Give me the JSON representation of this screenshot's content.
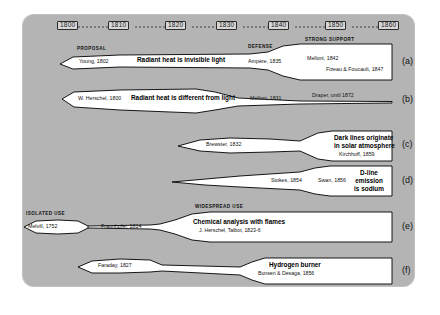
{
  "figure": {
    "type": "timeline-diagram",
    "background_color": "#b4b4b4",
    "band_fill": "#ffffff",
    "band_stroke": "#000000"
  },
  "axis": {
    "name": "decade-axis",
    "ticks": [
      "1800",
      "1810",
      "1820",
      "1830",
      "1840",
      "1850",
      "1860"
    ]
  },
  "rows": [
    {
      "id": "a",
      "label": "(a)",
      "phases": [
        {
          "caption": "PROPOSAL",
          "name": "Young, 1802"
        },
        {
          "caption": "DEFENSE",
          "name": "Ampère, 1835"
        },
        {
          "caption": "STRONG SUPPORT",
          "name": "Melloni, 1842",
          "name2": "Fizeau & Foucault, 1847"
        }
      ],
      "statement": "Radiant heat is invisible light"
    },
    {
      "id": "b",
      "label": "(b)",
      "phases": [
        {
          "name": "W. Herschel, 1800"
        },
        {
          "name": "Melloni, 1831"
        },
        {
          "name": "Draper, until 1872"
        }
      ],
      "statement": "Radiant heat is different from light"
    },
    {
      "id": "c",
      "label": "(c)",
      "phases": [
        {
          "name": "Brewster, 1832"
        },
        {
          "name": "Kirchhoff, 1859"
        }
      ],
      "statement_line1": "Dark lines originate",
      "statement_line2": "in solar atmosphere"
    },
    {
      "id": "d",
      "label": "(d)",
      "phases": [
        {
          "name": "Stokes, 1854"
        },
        {
          "name": "Swan, 1856"
        }
      ],
      "statement_line1": "D-line",
      "statement_line2": "emission",
      "statement_line3": "is sodium"
    },
    {
      "id": "e",
      "label": "(e)",
      "phases": [
        {
          "caption": "ISOLATED USE",
          "name": "Melvill, 1752"
        },
        {
          "name": "Fraunhofer, 1814"
        },
        {
          "caption": "WIDESPREAD USE",
          "name": "J. Herschel, Talbot, 1823-6"
        }
      ],
      "statement": "Chemical analysis  with flames"
    },
    {
      "id": "f",
      "label": "(f)",
      "phases": [
        {
          "name": "Faraday, 1827"
        },
        {
          "name": "Bunsen & Desaga, 1856"
        }
      ],
      "statement": "Hydrogen burner"
    }
  ]
}
